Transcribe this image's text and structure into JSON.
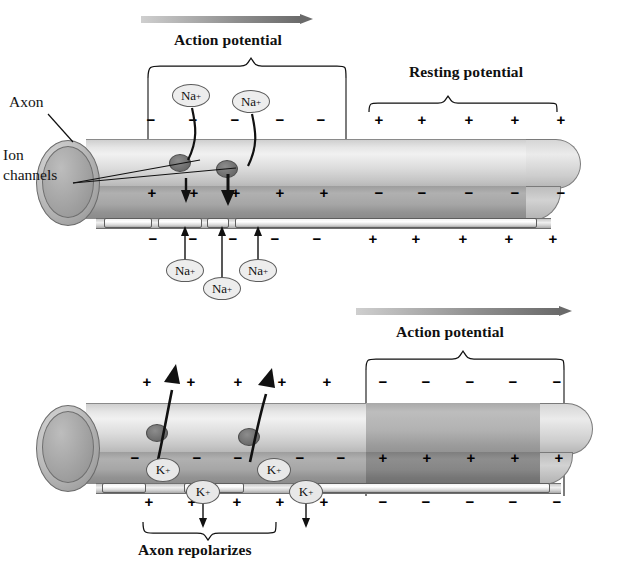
{
  "figure": {
    "title_top": "Action potential",
    "title_top_right": "Resting potential",
    "title_bottom_right": "Action potential",
    "title_bottom_caption": "Axon repolarizes",
    "label_axon": "Axon",
    "label_ion_channels_line1": "Ion",
    "label_ion_channels_line2": "channels",
    "ion_sodium": "Na",
    "ion_potassium": "K",
    "charge_positive": "+",
    "charge_negative": "−",
    "superscript_plus": "+"
  },
  "panel_top": {
    "name": "depolarization-panel",
    "propagation_arrow": "action-potential-direction",
    "outer_charges_left": [
      "−",
      "−",
      "−",
      "−",
      "−"
    ],
    "outer_charges_right": [
      "+",
      "+",
      "+",
      "+",
      "+"
    ],
    "inner_charges_left": [
      "+",
      "+",
      "+",
      "+",
      "+"
    ],
    "inner_charges_right": [
      "−",
      "−",
      "−",
      "−",
      "−"
    ],
    "below_charges_left": [
      "−",
      "−",
      "−",
      "−",
      "−"
    ],
    "below_charges_right": [
      "+",
      "+",
      "+",
      "+",
      "+"
    ],
    "ions_inside": [
      "Na",
      "Na"
    ],
    "ions_outside": [
      "Na",
      "Na",
      "Na"
    ]
  },
  "panel_bottom": {
    "name": "repolarization-panel",
    "propagation_arrow": "action-potential-direction",
    "outer_charges_left": [
      "+",
      "+",
      "+",
      "+",
      "+"
    ],
    "outer_charges_right": [
      "−",
      "−",
      "−",
      "−",
      "−"
    ],
    "inner_charges_left": [
      "−",
      "−",
      "−",
      "−",
      "−"
    ],
    "inner_charges_right": [
      "+",
      "+",
      "+",
      "+",
      "+"
    ],
    "below_charges_left": [
      "+",
      "+",
      "+",
      "+",
      "+"
    ],
    "below_charges_right": [
      "−",
      "−",
      "−",
      "−",
      "−"
    ],
    "ions_inside": [
      "K",
      "K"
    ],
    "ions_membrane": [
      "K",
      "K"
    ]
  },
  "colors": {
    "ink": "#141414",
    "axon_outer": "#e6e6e6",
    "axon_inner": "#a6a6a6",
    "axon_inner_dark": "#868686",
    "arrow_dark": "#6a6a6a",
    "arrow_light": "#cfcfcf"
  }
}
